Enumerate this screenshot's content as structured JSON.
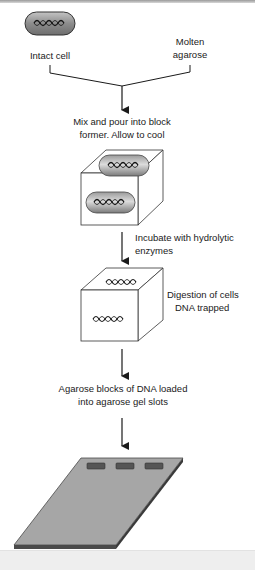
{
  "diagram": {
    "inputs": {
      "cell_label": "Intact cell",
      "agarose_label_lines": [
        "Molten",
        "agarose"
      ]
    },
    "steps": [
      {
        "id": "mix",
        "lines": [
          "Mix and pour into block",
          "former.  Allow to cool"
        ]
      },
      {
        "id": "incubate",
        "lines": [
          "Incubate with hydrolytic",
          "enzymes"
        ]
      },
      {
        "id": "digest",
        "lines": [
          "Digestion of cells",
          "DNA trapped"
        ]
      },
      {
        "id": "load",
        "lines": [
          "Agarose blocks of DNA loaded",
          "into agarose gel slots"
        ]
      }
    ],
    "gel_slots": 3,
    "colors": {
      "cell_fill": "#8c8c8c",
      "gel_fill": "#a6a6a6",
      "gel_edge": "#4a4a4a",
      "slot_fill": "#555555",
      "line": "#1a1a1a"
    }
  }
}
